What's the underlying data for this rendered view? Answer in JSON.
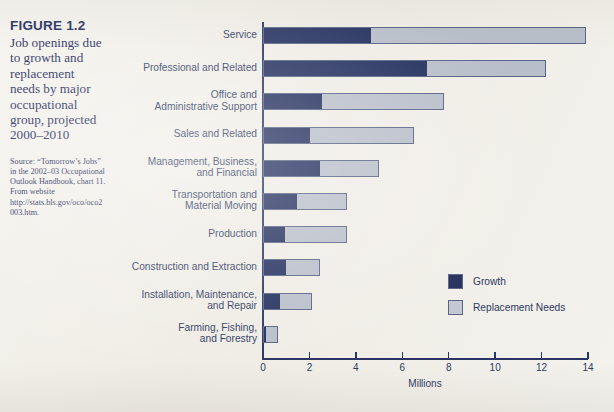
{
  "figure": {
    "number": "FIGURE 1.2",
    "title": "Job openings due to growth and replacement needs by major occupational group, projected 2000–2010",
    "source": "Source: “Tomorrow’s Jobs” in the 2002–03 Occupational Outlook Handbook, chart 11. From website http://stats.bls.gov/oco/oco2003.htm."
  },
  "colors": {
    "growth": "#24305e",
    "replacement": "#b9bfca",
    "text": "#2d3a63",
    "page": "#f3f1ec"
  },
  "legend": {
    "position": "inside-right",
    "entries": [
      {
        "label": "Growth",
        "color": "#24305e"
      },
      {
        "label": "Replacement Needs",
        "color": "#c3c8d2"
      }
    ]
  },
  "axis": {
    "x_title": "Millions",
    "x_ticks": [
      "0",
      "2",
      "4",
      "6",
      "8",
      "10",
      "12",
      "14"
    ]
  },
  "chart_data": {
    "type": "bar",
    "orientation": "horizontal",
    "stacked": true,
    "title": "Job openings due to growth and replacement needs by major occupational group, projected 2000–2010",
    "xlabel": "Millions",
    "ylabel": "",
    "xlim": [
      0,
      14
    ],
    "xticks": [
      0,
      2,
      4,
      6,
      8,
      10,
      12,
      14
    ],
    "grid": false,
    "legend_position": "inside-right",
    "categories": [
      "Service",
      "Professional and Related",
      "Office and Administrative Support",
      "Sales and Related",
      "Management, Business, and Financial",
      "Transportation and Material Moving",
      "Production",
      "Construction and Extraction",
      "Installation, Maintenance, and Repair",
      "Farming, Fishing, and Forestry"
    ],
    "category_lines": [
      [
        "Service"
      ],
      [
        "Professional and Related"
      ],
      [
        "Office and",
        "Administrative Support"
      ],
      [
        "Sales and Related"
      ],
      [
        "Management, Business,",
        "and Financial"
      ],
      [
        "Transportation and",
        "Material Moving"
      ],
      [
        "Production"
      ],
      [
        "Construction and Extraction"
      ],
      [
        "Installation, Maintenance,",
        "and Repair"
      ],
      [
        "Farming, Fishing,",
        "and Forestry"
      ]
    ],
    "series": [
      {
        "name": "Growth",
        "color": "#24305e",
        "values": [
          4.6,
          7.0,
          2.5,
          2.0,
          2.4,
          1.4,
          0.9,
          0.95,
          0.7,
          0.1
        ]
      },
      {
        "name": "Replacement Needs",
        "color": "#b9bfca",
        "values": [
          9.3,
          5.2,
          5.3,
          4.5,
          2.6,
          2.2,
          2.7,
          1.5,
          1.4,
          0.55
        ]
      }
    ],
    "totals": [
      13.9,
      12.2,
      7.8,
      6.5,
      5.0,
      3.6,
      3.6,
      2.45,
      2.1,
      0.65
    ]
  }
}
